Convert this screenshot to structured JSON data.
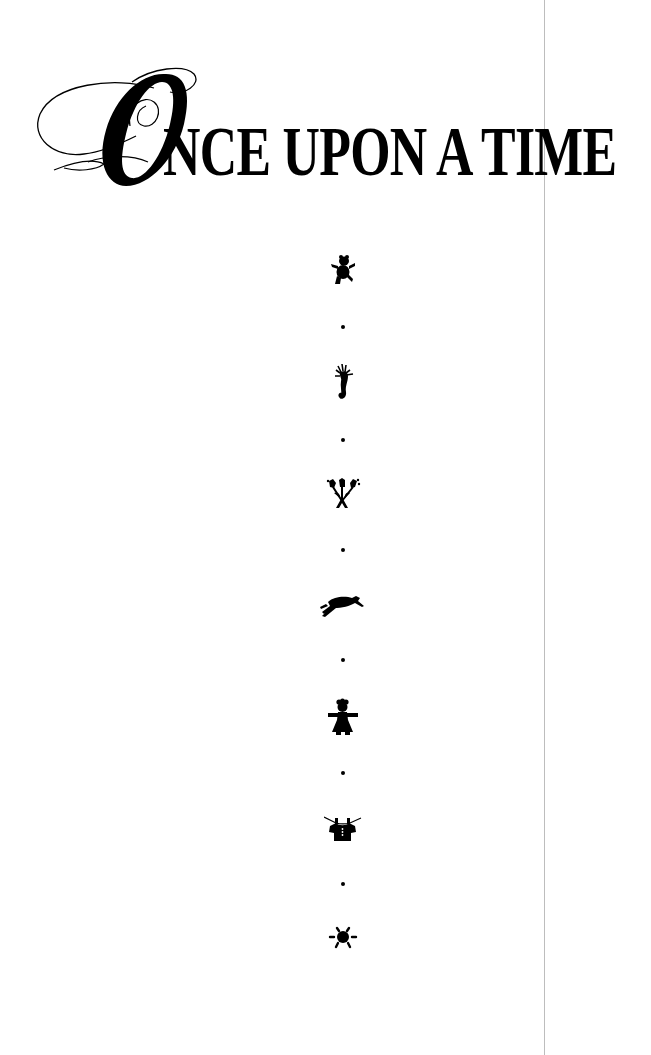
{
  "page": {
    "title": {
      "initial": "O",
      "rest": "NCE UPON A TIME",
      "full": "ONCE UPON A TIME"
    },
    "ornaments": [
      {
        "icon": "teddy-bear-icon",
        "y": 270
      },
      {
        "icon": "seahorse-icon",
        "y": 383
      },
      {
        "icon": "tulip-bouquet-icon",
        "y": 493
      },
      {
        "icon": "running-dog-icon",
        "y": 605
      },
      {
        "icon": "girl-doll-icon",
        "y": 718
      },
      {
        "icon": "shirt-on-clothesline-icon",
        "y": 830
      },
      {
        "icon": "sun-icon",
        "y": 937
      }
    ],
    "separator_dots_y": [
      327,
      440,
      550,
      660,
      773,
      884
    ],
    "colors": {
      "ink": "#000000",
      "background": "#ffffff",
      "page_edge": "#bdbdbd"
    }
  }
}
